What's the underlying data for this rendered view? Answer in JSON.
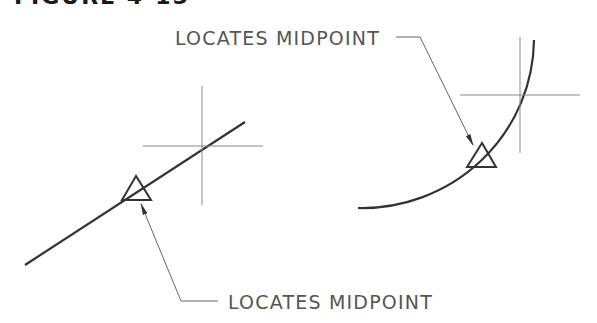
{
  "figure": {
    "title_clipped": "FIGURE 4-15"
  },
  "labels": {
    "top_right": "LOCATES MIDPOINT",
    "bottom": "LOCATES MIDPOINT"
  },
  "colors": {
    "object_line": "#333333",
    "construction_line": "#888888",
    "leader": "#666666",
    "text": "#555555"
  },
  "drawings": [
    {
      "name": "line-midpoint",
      "object": "line",
      "marker": "triangle"
    },
    {
      "name": "arc-midpoint",
      "object": "arc",
      "marker": "triangle"
    }
  ]
}
